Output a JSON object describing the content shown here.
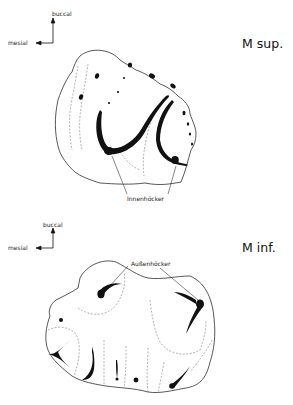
{
  "upper": {
    "title": "M sup.",
    "orientation": {
      "vertical": "buccal",
      "horizontal": "mesial"
    },
    "annotation": "Innenhöcker"
  },
  "lower": {
    "title": "M inf.",
    "orientation": {
      "vertical": "buccal",
      "horizontal": "mesial"
    },
    "annotation": "Außenhöcker"
  },
  "colors": {
    "line": "#111111",
    "dashed": "#666666",
    "background": "#ffffff"
  }
}
